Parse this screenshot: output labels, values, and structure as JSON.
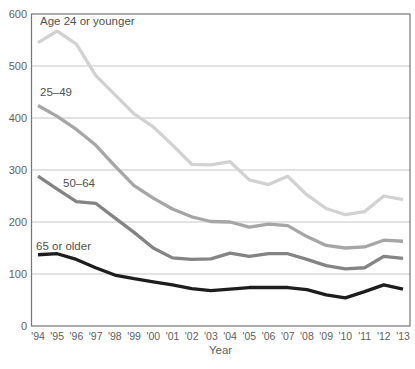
{
  "chart_data": {
    "type": "line",
    "title": "",
    "xlabel": "Year",
    "ylabel": "",
    "ylim": [
      0,
      600
    ],
    "yticks": [
      0,
      100,
      200,
      300,
      400,
      500,
      600
    ],
    "grid": "horizontal",
    "legend_position": "inline-labels",
    "categories": [
      "'94",
      "'95",
      "'96",
      "'97",
      "'98",
      "'99",
      "'00",
      "'01",
      "'02",
      "'03",
      "'04",
      "'05",
      "'06",
      "'07",
      "'08",
      "'09",
      "'10",
      "'11",
      "'12",
      "'13"
    ],
    "series": [
      {
        "name": "Age 24 or younger",
        "color": "#d2d2d2",
        "values": [
          545,
          567,
          542,
          482,
          445,
          408,
          383,
          348,
          311,
          310,
          316,
          281,
          272,
          288,
          252,
          226,
          214,
          220,
          250,
          243
        ]
      },
      {
        "name": "25–49",
        "color": "#a6a6a6",
        "values": [
          424,
          403,
          378,
          348,
          308,
          270,
          246,
          225,
          210,
          201,
          200,
          190,
          196,
          193,
          172,
          155,
          150,
          152,
          165,
          163
        ]
      },
      {
        "name": "50–64",
        "color": "#848484",
        "values": [
          288,
          263,
          239,
          236,
          208,
          180,
          150,
          131,
          128,
          129,
          140,
          134,
          139,
          139,
          128,
          116,
          110,
          112,
          134,
          130
        ]
      },
      {
        "name": "65 or older",
        "color": "#1d1d1d",
        "values": [
          137,
          139,
          128,
          112,
          98,
          91,
          85,
          79,
          72,
          68,
          71,
          74,
          74,
          74,
          70,
          60,
          54,
          66,
          79,
          71
        ]
      }
    ],
    "colors": {
      "frame": "#757575",
      "gridline": "#c6c6c6",
      "tick_text": "#606060",
      "label_text": "#4f4f4f",
      "background": "#ffffff"
    }
  }
}
